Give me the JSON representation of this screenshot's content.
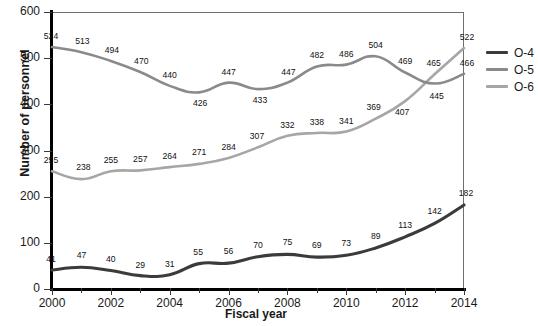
{
  "chart_data": {
    "type": "line",
    "title": "",
    "xlabel": "Fiscal year",
    "ylabel": "Number of personnel",
    "categories": [
      2000,
      2001,
      2002,
      2003,
      2004,
      2005,
      2006,
      2007,
      2008,
      2009,
      2010,
      2011,
      2012,
      2013,
      2014
    ],
    "xlim": [
      2000,
      2014
    ],
    "ylim": [
      0,
      600
    ],
    "yticks": [
      0,
      100,
      200,
      300,
      400,
      500,
      600
    ],
    "xticks_major": [
      2000,
      2002,
      2004,
      2006,
      2008,
      2010,
      2012,
      2014
    ],
    "xticks_minor": [
      2001,
      2003,
      2005,
      2007,
      2009,
      2011,
      2013
    ],
    "grid": false,
    "legend_position": "right",
    "series": [
      {
        "name": "O-4",
        "color": "#3b3b3b",
        "values": [
          41,
          47,
          40,
          29,
          31,
          55,
          56,
          70,
          75,
          69,
          73,
          89,
          113,
          142,
          182
        ]
      },
      {
        "name": "O-5",
        "color": "#8a8a8a",
        "values": [
          524,
          513,
          494,
          470,
          440,
          426,
          447,
          433,
          447,
          482,
          486,
          504,
          469,
          445,
          466
        ]
      },
      {
        "name": "O-6",
        "color": "#a6a6a6",
        "values": [
          255,
          238,
          255,
          257,
          264,
          271,
          284,
          307,
          332,
          338,
          341,
          369,
          407,
          465,
          522
        ]
      }
    ]
  },
  "legend": {
    "items": [
      {
        "label": "O-4",
        "color": "#3b3b3b"
      },
      {
        "label": "O-5",
        "color": "#8a8a8a"
      },
      {
        "label": "O-6",
        "color": "#a6a6a6"
      }
    ]
  }
}
